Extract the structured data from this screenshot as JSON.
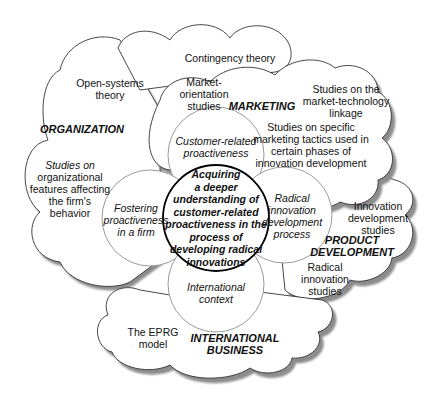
{
  "diagram": {
    "center": {
      "lines": [
        "Acquiring",
        "a deeper",
        "understanding of",
        "customer-related",
        "proactiveness in the",
        "process of",
        "developing radical",
        "innovations"
      ]
    },
    "petals": {
      "top": [
        "Customer-related",
        "proactiveness"
      ],
      "left": [
        "Fostering",
        "proactiveness",
        "in a firm"
      ],
      "right": [
        "Radical",
        "innovation",
        "development",
        "process"
      ],
      "bottom": [
        "International",
        "context"
      ]
    },
    "domains": {
      "organization": {
        "title": "ORGANIZATION",
        "items": [
          [
            "Open-systems",
            "theory"
          ],
          [
            "Studies on",
            "organizational",
            "features affecting",
            "the firm's",
            "behavior"
          ]
        ]
      },
      "contingency": [
        "Contingency theory"
      ],
      "marketing": {
        "title": "MARKETING",
        "items": [
          [
            "Market-",
            "orientation",
            "studies"
          ],
          [
            "Studies on the",
            "market-technology",
            "linkage"
          ],
          [
            "Studies on specific",
            "marketing tactics used in",
            "certain phases of",
            "innovation development"
          ]
        ]
      },
      "product_development": {
        "title": [
          "PRODUCT",
          "DEVELOPMENT"
        ],
        "items": [
          [
            "Innovation",
            "development",
            "studies"
          ],
          [
            "Radical",
            "innovation",
            "studies"
          ]
        ]
      },
      "international_business": {
        "title": [
          "INTERNATIONAL",
          "BUSINESS"
        ],
        "items": [
          [
            "The EPRG",
            "model"
          ]
        ]
      }
    },
    "colors": {
      "stroke": "#333333",
      "petal_stroke": "#9a9a9a",
      "shadow": "#8c8c8c",
      "fill": "#ffffff",
      "center_stroke": "#000000"
    }
  }
}
